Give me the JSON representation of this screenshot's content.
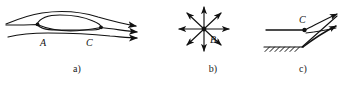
{
  "figure": {
    "title": "",
    "background_color": "#ffffff",
    "stroke_color": "#111111",
    "panels": [
      {
        "id": "a",
        "caption": "a)",
        "description": "streamlines over a body with a closed separation bubble",
        "point_labels": [
          {
            "name": "A",
            "text": "A"
          },
          {
            "name": "C",
            "text": "C"
          }
        ]
      },
      {
        "id": "b",
        "caption": "b)",
        "description": "radial node with eight outward arrows",
        "point_labels": [
          {
            "name": "B",
            "text": "B"
          }
        ]
      },
      {
        "id": "c",
        "caption": "c)",
        "description": "separation saddle point on a hatched wall",
        "point_labels": [
          {
            "name": "C",
            "text": "C"
          }
        ]
      }
    ],
    "captions": {
      "a": "a)",
      "b": "b)",
      "c": "c)"
    },
    "labels": {
      "a_point_A": "A",
      "a_point_C": "C",
      "b_point_B": "B",
      "c_point_C": "C"
    }
  }
}
